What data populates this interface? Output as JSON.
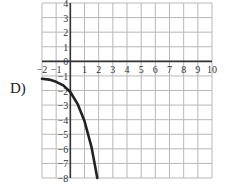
{
  "choice_label": "D)",
  "chart_data": {
    "type": "line",
    "title": "",
    "xlabel": "",
    "ylabel": "",
    "xlim": [
      -2,
      10
    ],
    "ylim": [
      -8,
      4
    ],
    "grid": true,
    "x_ticks": [
      "-2",
      "-1",
      "1",
      "2",
      "3",
      "4",
      "5",
      "6",
      "7",
      "8",
      "9",
      "10"
    ],
    "y_ticks": [
      "4",
      "3",
      "2",
      "1",
      "0",
      "-1",
      "-2",
      "-3",
      "-4",
      "-5",
      "-6",
      "-7",
      "-8"
    ],
    "series": [
      {
        "name": "curve",
        "x": [
          -2,
          -1.5,
          -1,
          -0.5,
          0,
          0.5,
          1,
          1.5,
          1.9
        ],
        "y": [
          -1.2,
          -1.25,
          -1.4,
          -1.65,
          -2.1,
          -2.9,
          -4.1,
          -5.9,
          -8
        ]
      }
    ]
  },
  "colors": {
    "grid": "#b8b8b8",
    "axis": "#333333",
    "curve": "#222222"
  }
}
